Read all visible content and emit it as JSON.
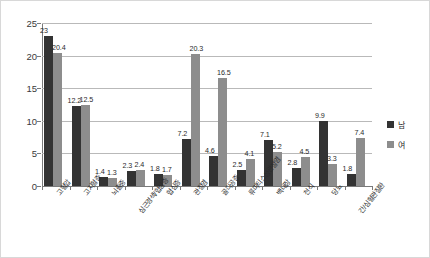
{
  "chart_data": {
    "type": "bar",
    "title": "",
    "subtitle": "",
    "xlabel": "",
    "ylabel": "",
    "ylim": [
      0,
      25
    ],
    "ytick_labels": [
      "0",
      "5",
      "10",
      "15",
      "20",
      "25"
    ],
    "ytick_values": [
      0,
      5,
      10,
      15,
      20,
      25
    ],
    "grid": true,
    "legend_position": "right",
    "categories": [
      "고혈압",
      "고지혈증",
      "뇌졸중",
      "심근경색/협심증",
      "협심증",
      "관절염",
      "골다공증",
      "류마티스성관절염",
      "백내장",
      "천식",
      "당뇨",
      "간/심혈관질환"
    ],
    "categories_plotted": [
      "고혈압",
      "고지혈증",
      "뇌졸중",
      "심근경색/협심증",
      "협심증",
      "관절염",
      "골다공증",
      "류마티스성관절염",
      "백내장",
      "천식",
      "당뇨",
      "간/심혈관질환"
    ],
    "series": [
      {
        "name": "남",
        "color": "#333333",
        "values": [
          23,
          12.2,
          1.4,
          2.3,
          1.8,
          7.2,
          4.6,
          2.5,
          7.1,
          2.8,
          9.9,
          1.8
        ]
      },
      {
        "name": "여",
        "color": "#8d8d8d",
        "values": [
          20.4,
          12.5,
          1.3,
          2.4,
          1.7,
          20.3,
          16.5,
          4.1,
          5.2,
          4.5,
          3.3,
          7.4
        ]
      }
    ]
  },
  "legend": {
    "items": [
      {
        "label": "남"
      },
      {
        "label": "여"
      }
    ]
  }
}
